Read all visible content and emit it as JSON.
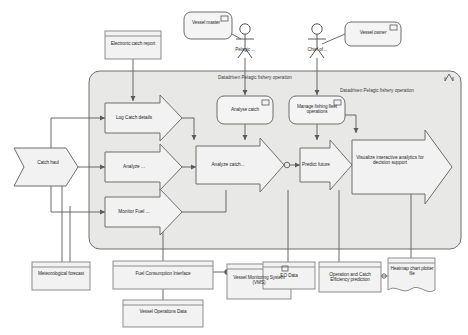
{
  "diagram": {
    "type": "archimate-uml-fishery-operation",
    "background": "#ffffff",
    "container_fill": "#e8e8e6",
    "container_stroke": "#6f6f6f",
    "node_fill": "#f2f2f2",
    "arrow_fill": "#f2f2f2",
    "stroke": "#6f6f6f"
  },
  "containers": [
    {
      "id": "outer",
      "label": "Datadriven Pelagic fishery operation"
    },
    {
      "id": "inner",
      "label": "Datadriven Pelagic fishery operation"
    }
  ],
  "actors": [
    {
      "id": "pelagic",
      "label": "Pelagic ...",
      "icon": "stick-figure-actor"
    },
    {
      "id": "chief",
      "label": "Chief of...",
      "icon": "stick-figure-actor"
    }
  ],
  "roles": [
    {
      "id": "vessel-master",
      "label": "Vessel master",
      "icon": "component-icon"
    },
    {
      "id": "vessel-owner",
      "label": "Vessel owner",
      "icon": "component-icon"
    }
  ],
  "objects": [
    {
      "id": "electronic-catch-report",
      "label": "Electronic catch report",
      "shape": "object"
    },
    {
      "id": "meteorological-forecast",
      "label": "Meteorological forecast",
      "shape": "object"
    },
    {
      "id": "fuel-consumption-interface",
      "label": "Fuel Consumption Interface",
      "shape": "object",
      "icon": "interface-socket-icon"
    },
    {
      "id": "vessel-monitoring-system",
      "label": "Vessel Monitoring System (VMS)",
      "shape": "object",
      "icon": "component-icon"
    },
    {
      "id": "vessel-operations-data",
      "label": "Vessel Operations Data",
      "shape": "object"
    },
    {
      "id": "eo-data",
      "label": "EO Data",
      "shape": "object"
    },
    {
      "id": "operation-catch-efficiency",
      "label": "Operation and Catch Efficiency prediction",
      "shape": "object"
    },
    {
      "id": "heatmap-chart-plotter",
      "label": "Heatmap chart plotter file",
      "shape": "document"
    },
    {
      "id": "catch-haul",
      "label": "Catch haul",
      "shape": "pennant"
    }
  ],
  "processes": [
    {
      "id": "log-catch-details",
      "label": "Log Catch details",
      "shape": "arrow"
    },
    {
      "id": "analyze",
      "label": "Analyze ...",
      "shape": "arrow"
    },
    {
      "id": "monitor-fuel",
      "label": "Monitor Fuel ...",
      "shape": "arrow"
    },
    {
      "id": "analyze-catch-process",
      "label": "Analyze catch...",
      "shape": "arrow"
    },
    {
      "id": "predict-future",
      "label": "Predict future",
      "shape": "arrow"
    },
    {
      "id": "visualize-analytics",
      "label": "Visualize interactive analytics for decision support",
      "shape": "arrow"
    }
  ],
  "functions": [
    {
      "id": "analyse-catch",
      "label": "Analyse catch",
      "icon": "function-icon"
    },
    {
      "id": "manage-fishing-fleet",
      "label": "Manage fishing fleet operations",
      "icon": "function-icon"
    }
  ]
}
